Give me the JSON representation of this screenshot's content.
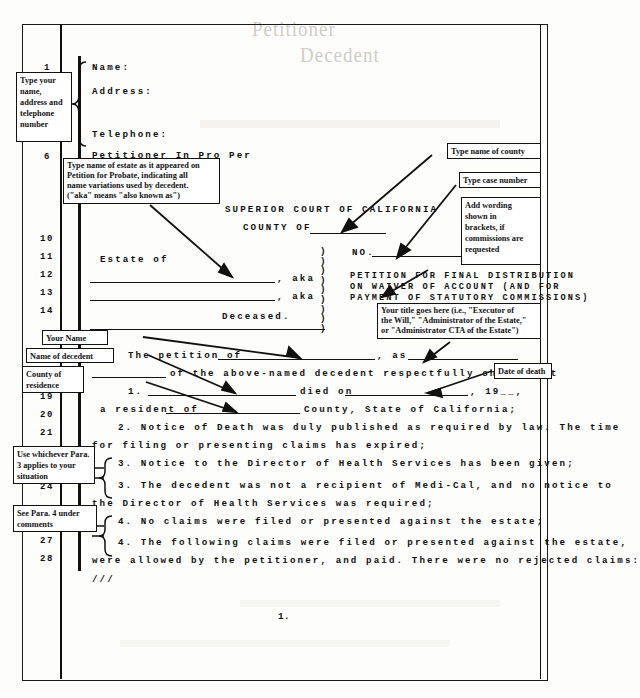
{
  "document": {
    "kind": "annotated-legal-pleading-form",
    "page_number": "1.",
    "ghost_bleed": [
      "Petitioner",
      "Decedent"
    ]
  },
  "caption": {
    "name_label": "Name:",
    "address_label": "Address:",
    "telephone_label": "Telephone:",
    "pro_per_label": "Petitioner In Pro Per",
    "court_title": "SUPERIOR COURT OF CALIFORNIA",
    "county_of": "COUNTY OF",
    "estate_of": "Estate of",
    "aka1": ", aka",
    "aka2": ", aka",
    "deceased": "Deceased.",
    "case_no_label": "NO.",
    "title_line1": "PETITION FOR FINAL DISTRIBUTION",
    "title_line2": "ON WAIVER OF ACCOUNT (AND FOR",
    "title_line3": "PAYMENT OF STATUTORY COMMISSIONS)",
    "paren_column": ")"
  },
  "body": {
    "petition_lead": "The petition of",
    "petition_as": ", as",
    "petition_tail": "of the above-named decedent respectfully shows that",
    "p1_num": "1.",
    "p1_died_on": "died on",
    "p1_year": ", 19__,",
    "p1_resident": "a resident of",
    "p1_county_state": "County, State of California;",
    "p2": "2. Notice of Death was duly published as required by law. The time",
    "p2_cont": "for filing or presenting claims has expired;",
    "p3a": "3. Notice to the Director of Health Services has been given;",
    "p3b": "3. The decedent was not a recipient of Medi-Cal, and no notice to",
    "p3b_cont": "the Director of Health Services was required;",
    "p4a": "4. No claims were filed or presented against the estate;",
    "p4b": "4. The following claims were filed or presented against the estate,",
    "p4b_cont": "were allowed by the petitioner, and paid. There were no rejected claims:",
    "slashes": "///"
  },
  "line_numbers": [
    "1",
    "5",
    "6",
    "10",
    "11",
    "12",
    "13",
    "14",
    "19",
    "20",
    "21",
    "24",
    "27",
    "28"
  ],
  "annotations": [
    {
      "id": "type-your-name-address",
      "lines": [
        "Type your",
        "name,",
        "address and",
        "telephone",
        "number"
      ]
    },
    {
      "id": "type-name-of-estate",
      "lines": [
        "Type name of estate as it appeared on",
        "Petition for Probate, indicating all",
        "name variations used by decedent.",
        "(\"aka\" means \"also known as\")"
      ]
    },
    {
      "id": "type-name-of-county",
      "lines": [
        "Type name of county"
      ]
    },
    {
      "id": "type-case-number",
      "lines": [
        "Type case number"
      ]
    },
    {
      "id": "add-wording-brackets",
      "lines": [
        "Add wording",
        "shown in",
        "brackets, if",
        "commissions are",
        "requested"
      ]
    },
    {
      "id": "your-title-goes-here",
      "lines": [
        "Your title goes here (i.e., \"Executor of",
        "the Will,\" \"Administrator of the Estate,\"",
        "or \"Administrator CTA of the Estate\")"
      ]
    },
    {
      "id": "your-name",
      "lines": [
        "Your Name"
      ]
    },
    {
      "id": "name-of-decedent",
      "lines": [
        "Name of decedent"
      ]
    },
    {
      "id": "county-of-residence",
      "lines": [
        "County of",
        "residence"
      ]
    },
    {
      "id": "date-of-death",
      "lines": [
        "Date of death"
      ]
    },
    {
      "id": "use-whichever-para-3",
      "lines": [
        "Use whichever Para.",
        "3 applies to your",
        "situation"
      ]
    },
    {
      "id": "see-para-4-under-comments",
      "lines": [
        "See Para. 4 under",
        "comments"
      ]
    }
  ],
  "colors": {
    "ink": "#111111",
    "paper": "#fdfdfb",
    "ghost": "#cfcdc8"
  }
}
